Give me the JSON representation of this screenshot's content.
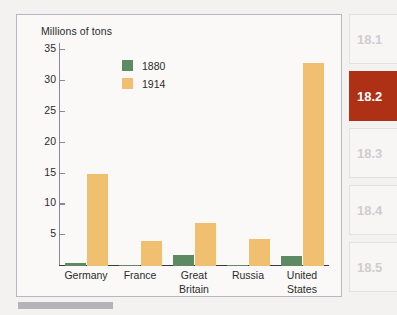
{
  "chart_data": {
    "type": "bar",
    "title": "",
    "ylabel": "Millions of tons",
    "xlabel": "",
    "ylim": [
      0,
      36
    ],
    "yticks": [
      5,
      10,
      15,
      20,
      25,
      30,
      35
    ],
    "grid": false,
    "legend_position": "inside-top-left",
    "categories": [
      "Germany",
      "France",
      "Great Britain",
      "Russia",
      "United States"
    ],
    "series": [
      {
        "name": "1880",
        "color": "#5d8a63",
        "values": [
          0.5,
          0.2,
          1.8,
          0.2,
          1.7
        ]
      },
      {
        "name": "1914",
        "color": "#f0c070",
        "values": [
          15,
          4,
          7,
          4.4,
          33
        ]
      }
    ]
  },
  "chart": {
    "axis_title": "Millions of tons",
    "y_ticks": [
      "35",
      "30",
      "25",
      "20",
      "15",
      "10",
      "5"
    ],
    "categories": [
      {
        "line1": "Germany",
        "line2": ""
      },
      {
        "line1": "France",
        "line2": ""
      },
      {
        "line1": "Great",
        "line2": "Britain"
      },
      {
        "line1": "Russia",
        "line2": ""
      },
      {
        "line1": "United",
        "line2": "States"
      }
    ],
    "legend": [
      {
        "label": "1880",
        "color": "#5d8a63"
      },
      {
        "label": "1914",
        "color": "#f0c070"
      }
    ]
  },
  "sidebar": {
    "tabs": [
      {
        "label": "18.1",
        "active": false
      },
      {
        "label": "18.2",
        "active": true
      },
      {
        "label": "18.3",
        "active": false
      },
      {
        "label": "18.4",
        "active": false
      },
      {
        "label": "18.5",
        "active": false
      }
    ]
  },
  "colors": {
    "series_1880": "#5d8a63",
    "series_1914": "#f0c070",
    "active_tab": "#ae3116",
    "frame_border": "#b9b6c2",
    "page_background": "#f3f2f0"
  }
}
